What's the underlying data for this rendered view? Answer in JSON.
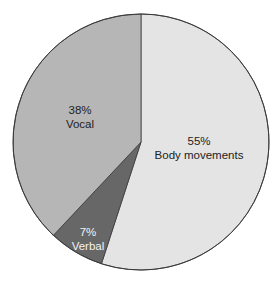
{
  "chart_data": {
    "type": "pie",
    "title": "",
    "start_angle_deg": 0,
    "direction": "clockwise",
    "legend": "none",
    "slices": [
      {
        "label": "Body movements",
        "value": 55,
        "display": "55%",
        "color": "#e4e4e4",
        "text_color": "#222222"
      },
      {
        "label": "Verbal",
        "value": 7,
        "display": "7%",
        "color": "#676767",
        "text_color": "#f2f2f2"
      },
      {
        "label": "Vocal",
        "value": 38,
        "display": "38%",
        "color": "#b6b6b6",
        "text_color": "#222222"
      }
    ]
  },
  "labels": {
    "body": {
      "pct": "55%",
      "name": "Body movements"
    },
    "verbal": {
      "pct": "7%",
      "name": "Verbal"
    },
    "vocal": {
      "pct": "38%",
      "name": "Vocal"
    }
  }
}
